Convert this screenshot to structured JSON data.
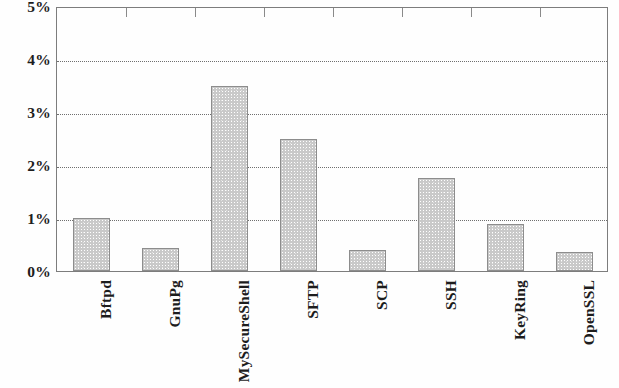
{
  "chart_data": {
    "type": "bar",
    "title": "",
    "subtitle": "",
    "xlabel": "",
    "ylabel": "",
    "categories": [
      "Bftpd",
      "GnuPg",
      "MySecureShell",
      "SFTP",
      "SCP",
      "SSH",
      "KeyRing",
      "OpenSSL"
    ],
    "values": [
      1.0,
      0.44,
      3.5,
      2.5,
      0.39,
      1.75,
      0.89,
      0.35
    ],
    "value_unit": "%",
    "ylim": [
      0,
      5
    ],
    "ytick_values": [
      0,
      1,
      2,
      3,
      4,
      5
    ],
    "ytick_labels": [
      "0%",
      "1%",
      "2%",
      "3%",
      "4%",
      "5%"
    ],
    "gridline_values": [
      1,
      2,
      3,
      4
    ],
    "grid": true,
    "grid_style": "dotted",
    "legend": null,
    "legend_position": "none",
    "annotations": [],
    "bar_fill_color": "#c9c9c9",
    "bar_border_color": "#8d8d8d",
    "axis_color": "#7d7d7d",
    "grid_color": "#6f6f6f",
    "text_color": "#1d1d1d",
    "background_color": "#fefefe",
    "category_label_rotation": -90,
    "top_axis_separator_ticks": 7
  }
}
